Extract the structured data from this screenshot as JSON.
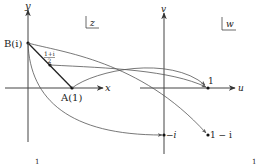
{
  "diagram": {
    "z_plane": {
      "plane_label": "z",
      "x_axis_label": "x",
      "y_axis_label": "y",
      "points": [
        {
          "id": "B",
          "label": "B(i)"
        },
        {
          "id": "M",
          "label_num": "1+i",
          "label_den": "2"
        },
        {
          "id": "A",
          "label": "A(1)"
        }
      ],
      "tick_label": "1"
    },
    "w_plane": {
      "plane_label": "w",
      "u_axis_label": "u",
      "v_axis_label": "v",
      "points": [
        {
          "id": "one",
          "label": "1"
        },
        {
          "id": "minus_i",
          "label": "−i"
        },
        {
          "id": "one_minus_i",
          "label": "1 − i"
        }
      ],
      "tick_label": "1"
    },
    "mappings": [
      {
        "from": "(1+i)/2",
        "to": "1"
      },
      {
        "from": "A(1)",
        "to": "1"
      },
      {
        "from": "B(i)",
        "to": "−i"
      },
      {
        "from": "B(i)",
        "to": "1 − i"
      }
    ],
    "colors": {
      "line": "#222222",
      "curve": "#555555"
    }
  }
}
